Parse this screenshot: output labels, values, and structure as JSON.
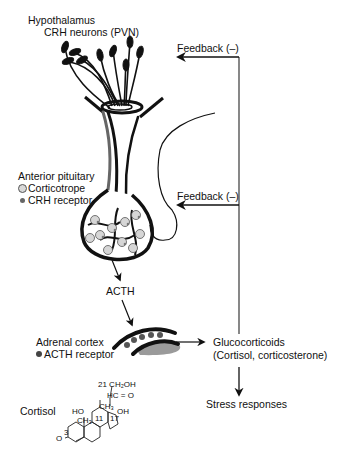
{
  "hypothalamus": {
    "title": "Hypothalamus",
    "subtitle": "CRH neurons (PVN)"
  },
  "feedback": {
    "upper": "Feedback (–)",
    "lower": "Feedback (–)"
  },
  "pituitary": {
    "title": "Anterior pituitary",
    "legend": [
      {
        "symbol": "corticotrope-ring",
        "label": "Corticotrope"
      },
      {
        "symbol": "crh-receptor-dot",
        "label": "CRH receptor"
      }
    ]
  },
  "acth": {
    "label": "ACTH"
  },
  "adrenal": {
    "title": "Adrenal cortex",
    "legend": [
      {
        "symbol": "acth-receptor-dot",
        "label": "ACTH receptor"
      }
    ]
  },
  "glucocorticoids": {
    "title": "Glucocorticoids",
    "subtitle": "(Cortisol, corticosterone)"
  },
  "stress": {
    "label": "Stress responses"
  },
  "cortisol": {
    "label": "Cortisol",
    "structure_labels": {
      "c21": "21 CH₂OH",
      "carbonyl": "HC = O",
      "ho": "HO",
      "oh": "OH",
      "ch3_a": "CH₃",
      "ch3_b": "CH₃",
      "ring11": "11",
      "ring17": "17",
      "ring3": "3",
      "keto": "O"
    }
  },
  "colors": {
    "line": "#111111",
    "feedback_line": "#555555",
    "cell_fill": "#d6d6d6",
    "gland_gray": "#9a9a9a"
  }
}
